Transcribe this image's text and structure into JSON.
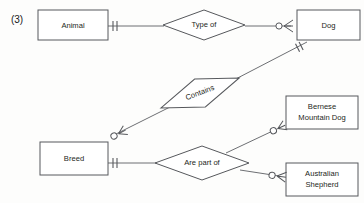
{
  "figure": {
    "number_label": "(3)",
    "background": "#fdfdfc",
    "line_color": "#56585c",
    "text_color": "#1d1f21"
  },
  "entities": [
    {
      "id": "animal",
      "label": "Animal",
      "x": 38,
      "y": 10,
      "w": 70,
      "h": 30
    },
    {
      "id": "dog",
      "label": "Dog",
      "x": 297,
      "y": 10,
      "w": 63,
      "h": 30
    },
    {
      "id": "breed",
      "label": "Breed",
      "x": 40,
      "y": 142,
      "w": 68,
      "h": 33
    },
    {
      "id": "bernese",
      "label_line1": "Bernese",
      "label_line2": "Mountain Dog",
      "x": 286,
      "y": 96,
      "w": 72,
      "h": 33
    },
    {
      "id": "australian",
      "label_line1": "Australian",
      "label_line2": "Shepherd",
      "x": 286,
      "y": 163,
      "w": 72,
      "h": 33
    }
  ],
  "relationships": [
    {
      "id": "type-of",
      "label": "Type of",
      "cx": 204,
      "cy": 25,
      "rx": 41,
      "ry": 15
    },
    {
      "id": "contains",
      "label": "Contains",
      "cx": 200,
      "cy": 93,
      "rx": 42,
      "ry": 15,
      "rotation": -21
    },
    {
      "id": "are-part-of",
      "label": "Are part of",
      "cx": 202,
      "cy": 163,
      "rx": 47,
      "ry": 17
    }
  ],
  "connections": [
    {
      "id": "animal-typeof",
      "from": "animal",
      "to": "type-of",
      "from_cardinality": "one-and-only-one",
      "to_cardinality": "plain"
    },
    {
      "id": "typeof-dog",
      "from": "type-of",
      "to": "dog",
      "from_cardinality": "plain",
      "to_cardinality": "zero-or-many"
    },
    {
      "id": "dog-contains-breed",
      "from": "dog",
      "to": "breed",
      "via": "contains",
      "from_cardinality": "one-and-only-one",
      "to_cardinality": "zero-or-many"
    },
    {
      "id": "breed-arepartof",
      "from": "breed",
      "to": "are-part-of",
      "from_cardinality": "one-and-only-one",
      "to_cardinality": "plain"
    },
    {
      "id": "arepartof-bernese",
      "from": "are-part-of",
      "to": "bernese",
      "to_cardinality": "zero-or-many"
    },
    {
      "id": "arepartof-australian",
      "from": "are-part-of",
      "to": "australian",
      "to_cardinality": "zero-or-many"
    }
  ]
}
